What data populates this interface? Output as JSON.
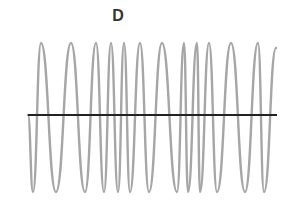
{
  "chart_data": {
    "type": "line",
    "title": "D",
    "xlabel": "",
    "ylabel": "",
    "grid": false,
    "legend": null,
    "baseline_y": 0,
    "ylim": [
      -1,
      1
    ],
    "extrema_px": [
      {
        "x": 28,
        "y": 115
      },
      {
        "x": 33,
        "y": 192
      },
      {
        "x": 41,
        "y": 43
      },
      {
        "x": 56,
        "y": 192
      },
      {
        "x": 71,
        "y": 43
      },
      {
        "x": 85,
        "y": 192
      },
      {
        "x": 96,
        "y": 43
      },
      {
        "x": 104,
        "y": 192
      },
      {
        "x": 111,
        "y": 43
      },
      {
        "x": 118,
        "y": 192
      },
      {
        "x": 124,
        "y": 43
      },
      {
        "x": 130,
        "y": 192
      },
      {
        "x": 140,
        "y": 43
      },
      {
        "x": 149,
        "y": 192
      },
      {
        "x": 162,
        "y": 43
      },
      {
        "x": 177,
        "y": 192
      },
      {
        "x": 184,
        "y": 43
      },
      {
        "x": 188,
        "y": 192
      },
      {
        "x": 197,
        "y": 43
      },
      {
        "x": 200,
        "y": 192
      },
      {
        "x": 209,
        "y": 43
      },
      {
        "x": 217,
        "y": 192
      },
      {
        "x": 231,
        "y": 43
      },
      {
        "x": 245,
        "y": 192
      },
      {
        "x": 258,
        "y": 43
      },
      {
        "x": 264,
        "y": 192
      },
      {
        "x": 276,
        "y": 48
      }
    ],
    "colors": {
      "wave": "#a6a6a6",
      "axis": "#222222",
      "title": "#333333"
    }
  }
}
